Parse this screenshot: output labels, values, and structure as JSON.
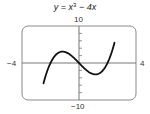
{
  "title": {
    "prefix": "y = x",
    "exponent": "3",
    "suffix": " − 4x"
  },
  "labels": {
    "ymax": "10",
    "ymin": "−10",
    "xmin": "−4",
    "xmax": "4"
  },
  "colors": {
    "curve": "#111111",
    "axis": "#777777",
    "frame": "#888888",
    "text": "#333333"
  },
  "chart_data": {
    "type": "line",
    "function": "y = x^3 - 4x",
    "xlabel": "",
    "ylabel": "",
    "xlim": [
      -4,
      4
    ],
    "ylim": [
      -10,
      10
    ],
    "yticks_step": 2,
    "xticks": [],
    "grid": false,
    "legend": null,
    "key_points": {
      "roots": [
        -2,
        0,
        2
      ],
      "local_max": {
        "x": -1.155,
        "y": 3.08
      },
      "local_min": {
        "x": 1.155,
        "y": -3.08
      },
      "enters_bottom_at_x": -2.49,
      "exits_top_at_x": 2.49
    },
    "series": [
      {
        "name": "y = x^3 - 4x",
        "x": [
          -2.49,
          -2.25,
          -2.0,
          -1.75,
          -1.5,
          -1.155,
          -1.0,
          -0.75,
          -0.5,
          -0.25,
          0,
          0.25,
          0.5,
          0.75,
          1.0,
          1.155,
          1.5,
          1.75,
          2.0,
          2.25,
          2.49
        ],
        "y": [
          -9.48,
          -2.39,
          0,
          1.64,
          2.63,
          3.08,
          3.0,
          2.58,
          1.88,
          0.98,
          0,
          -0.98,
          -1.88,
          -2.58,
          -3.0,
          -3.08,
          -2.63,
          -1.64,
          0,
          2.39,
          5.48
        ]
      }
    ]
  }
}
